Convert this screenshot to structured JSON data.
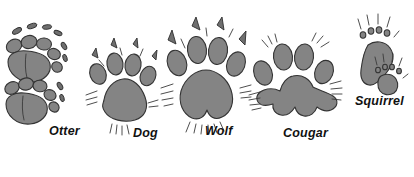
{
  "figure": {
    "background_color": "#ffffff",
    "pad_fill_color": "#848484",
    "outline_color": "#333333",
    "label_color": "#111111"
  },
  "tracks": [
    {
      "id": "otter",
      "label": "Otter",
      "label_x": 49,
      "label_y": 131,
      "toe_count": 5,
      "print_count": 2,
      "has_claw_marks": true,
      "description": "Two overlapping five-toed prints with separate claw dashes"
    },
    {
      "id": "dog",
      "label": "Dog",
      "label_x": 133,
      "label_y": 133,
      "toe_count": 4,
      "print_count": 1,
      "has_claw_marks": true,
      "description": "Four oval toes with claw marks above a triangular heel pad"
    },
    {
      "id": "wolf",
      "label": "Wolf",
      "label_x": 205,
      "label_y": 131,
      "toe_count": 4,
      "print_count": 1,
      "has_claw_marks": true,
      "description": "Large four-toed print with prominent claws and a lobed heel pad"
    },
    {
      "id": "cougar",
      "label": "Cougar",
      "label_x": 283,
      "label_y": 133,
      "toe_count": 4,
      "print_count": 1,
      "has_claw_marks": false,
      "description": "Four toes with no claw marks and a wide three-lobed heel pad"
    },
    {
      "id": "squirrel",
      "label": "Squirrel",
      "label_x": 355,
      "label_y": 101,
      "toe_count": 4,
      "print_count": 2,
      "has_claw_marks": true,
      "description": "Elongated hind foot and smaller front foot with thin clawed toes"
    }
  ]
}
